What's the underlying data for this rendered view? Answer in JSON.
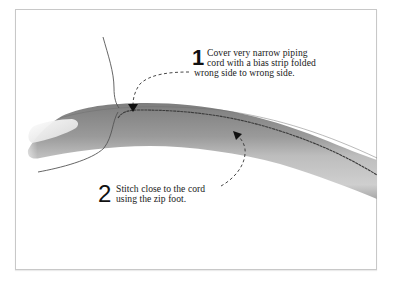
{
  "figure": {
    "type": "sewing-instruction-illustration",
    "colors": {
      "frame_border": "#c8c8c8",
      "fabric_dark": "#8a8a8a",
      "fabric_light": "#c9c9c9",
      "stitch_line": "#3a3a3a",
      "thread": "#555555",
      "text": "#1a1a1a"
    }
  },
  "callouts": [
    {
      "number": "1",
      "lines": [
        "Cover very narrow piping",
        "cord with a bias strip folded",
        "wrong side to wrong side."
      ]
    },
    {
      "number": "2",
      "lines": [
        "Stitch close to the cord",
        "using the zip foot."
      ]
    }
  ]
}
